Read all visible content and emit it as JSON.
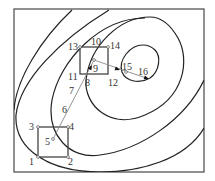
{
  "diagram": {
    "title": "",
    "colors": {
      "frame": "#555555",
      "contour": "#222222",
      "path": "#888888",
      "box": "#444444",
      "label": "#333333"
    },
    "frame": {
      "x": 14,
      "y": 9,
      "width": 190,
      "height": 163
    },
    "contours": [
      {
        "id": "c1",
        "d": "M 72 10 C 40 40, 16 80, 14 110"
      },
      {
        "id": "c2",
        "d": "M 109 10 C 60 40, 20 80, 16 115 C 14 150, 50 172, 100 172 C 140 172, 185 160, 204 128"
      },
      {
        "id": "c3",
        "d": "M 145 18 C 100 18, 60 60, 52 100 C 46 135, 70 160, 100 155 C 140 150, 185 120, 204 80"
      },
      {
        "id": "c4",
        "d": "M 150 17 C 120 17, 90 45, 86 80 C 84 105, 110 130, 145 115 C 185 98, 190 60, 178 38 C 170 24, 160 17, 150 17 Z"
      },
      {
        "id": "c5",
        "d": "M 143 45 C 130 45, 118 60, 122 72 C 126 82, 140 84, 150 78 C 160 71, 161 56, 155 50 C 151 46, 147 45, 143 45 Z"
      }
    ],
    "boxes": [
      {
        "id": "box-lower",
        "x": 38,
        "y": 127,
        "width": 30,
        "height": 30
      },
      {
        "id": "box-upper",
        "x": 80,
        "y": 47,
        "width": 28,
        "height": 27
      }
    ],
    "path_segments": [
      {
        "from": [
          53,
          139
        ],
        "to": [
          94,
          60
        ]
      },
      {
        "from": [
          94,
          60
        ],
        "to": [
          149,
          79
        ]
      }
    ],
    "arrows": [
      {
        "at": [
          92,
          65
        ],
        "angle": -62
      },
      {
        "at": [
          120,
          70
        ],
        "angle": 19
      },
      {
        "at": [
          149,
          79
        ],
        "angle": 19
      }
    ],
    "points": [
      {
        "label": "1",
        "x": 38,
        "y": 157,
        "lx": 29,
        "ly": 165
      },
      {
        "label": "2",
        "x": 68,
        "y": 157,
        "lx": 68,
        "ly": 165
      },
      {
        "label": "3",
        "x": 38,
        "y": 127,
        "lx": 29,
        "ly": 130
      },
      {
        "label": "4",
        "x": 68,
        "y": 127,
        "lx": 69,
        "ly": 130
      },
      {
        "label": "5",
        "x": 53,
        "y": 139,
        "lx": 45,
        "ly": 145
      },
      {
        "label": "6",
        "x": 0,
        "y": 0,
        "lx": 62,
        "ly": 113
      },
      {
        "label": "7",
        "x": 0,
        "y": 0,
        "lx": 69,
        "ly": 94
      },
      {
        "label": "8",
        "x": 0,
        "y": 0,
        "lx": 85,
        "ly": 86
      },
      {
        "label": "9",
        "x": 94,
        "y": 60,
        "lx": 93,
        "ly": 72
      },
      {
        "label": "10",
        "x": 0,
        "y": 0,
        "lx": 91,
        "ly": 45
      },
      {
        "label": "11",
        "x": 0,
        "y": 0,
        "lx": 68,
        "ly": 80
      },
      {
        "label": "12",
        "x": 0,
        "y": 0,
        "lx": 108,
        "ly": 86
      },
      {
        "label": "13",
        "x": 80,
        "y": 47,
        "lx": 68,
        "ly": 50
      },
      {
        "label": "14",
        "x": 108,
        "y": 47,
        "lx": 110,
        "ly": 49
      },
      {
        "label": "15",
        "x": 126,
        "y": 72,
        "lx": 122,
        "ly": 70
      },
      {
        "label": "16",
        "x": 0,
        "y": 0,
        "lx": 138,
        "ly": 75
      }
    ]
  }
}
